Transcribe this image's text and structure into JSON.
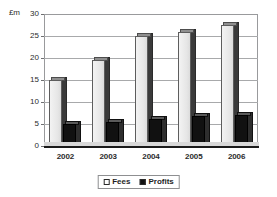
{
  "chart_data": {
    "type": "bar",
    "title": "",
    "subtitle": "",
    "xlabel": "",
    "ylabel": "£m",
    "categories": [
      "2002",
      "2003",
      "2004",
      "2005",
      "2006"
    ],
    "series": [
      {
        "name": "Fees",
        "values": [
          15,
          19.5,
          25,
          26,
          27.5
        ],
        "color": "#eeeeee"
      },
      {
        "name": "Profits",
        "values": [
          5,
          5.5,
          6.2,
          6.8,
          7
        ],
        "color": "#111111"
      }
    ],
    "ylim": [
      0,
      30
    ],
    "yticks": [
      "0",
      "5",
      "10",
      "15",
      "20",
      "25",
      "30"
    ],
    "ytick_values": [
      0,
      5,
      10,
      15,
      20,
      25,
      30
    ],
    "grid": true,
    "legend_position": "bottom",
    "style": "3d-column"
  },
  "legend": {
    "items": [
      {
        "label": "Fees",
        "swatch": "fees"
      },
      {
        "label": "Profits",
        "swatch": "profits"
      }
    ]
  }
}
